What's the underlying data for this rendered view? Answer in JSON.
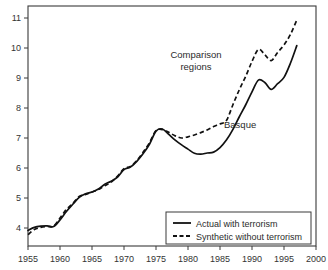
{
  "chart_data": {
    "type": "line",
    "title": "",
    "xlabel": "",
    "ylabel": "",
    "xlim": [
      1955,
      2000
    ],
    "ylim": [
      3.4,
      11.4
    ],
    "grid": false,
    "legend_position": "bottom-right",
    "xticks": [
      1955,
      1960,
      1965,
      1970,
      1975,
      1980,
      1985,
      1990,
      1995,
      2000
    ],
    "yticks": [
      4,
      5,
      6,
      7,
      8,
      9,
      10,
      11
    ],
    "x": [
      1955,
      1956,
      1957,
      1958,
      1959,
      1960,
      1961,
      1962,
      1963,
      1964,
      1965,
      1966,
      1967,
      1968,
      1969,
      1970,
      1971,
      1972,
      1973,
      1974,
      1975,
      1976,
      1977,
      1978,
      1979,
      1980,
      1981,
      1982,
      1983,
      1984,
      1985,
      1986,
      1987,
      1988,
      1989,
      1990,
      1991,
      1992,
      1993,
      1994,
      1995,
      1996,
      1997
    ],
    "series": [
      {
        "name": "Actual with terrorism",
        "style": "solid",
        "annotation": "Basque",
        "values": [
          3.92,
          4.02,
          4.06,
          4.07,
          4.05,
          4.27,
          4.55,
          4.79,
          5.02,
          5.14,
          5.2,
          5.3,
          5.46,
          5.56,
          5.7,
          5.95,
          6.03,
          6.22,
          6.48,
          6.8,
          7.23,
          7.3,
          7.12,
          6.93,
          6.77,
          6.63,
          6.49,
          6.46,
          6.5,
          6.53,
          6.68,
          6.93,
          7.28,
          7.7,
          8.1,
          8.54,
          8.93,
          8.85,
          8.62,
          8.81,
          9.02,
          9.49,
          10.08
        ]
      },
      {
        "name": "Synthetic without terrorism",
        "style": "dashed",
        "annotation": "Comparison regions",
        "values": [
          3.78,
          3.95,
          4.02,
          4.05,
          4.06,
          4.33,
          4.62,
          4.82,
          5.05,
          5.12,
          5.2,
          5.28,
          5.41,
          5.53,
          5.73,
          5.98,
          6.05,
          6.25,
          6.53,
          6.85,
          7.25,
          7.28,
          7.19,
          7.07,
          7.0,
          7.04,
          7.1,
          7.18,
          7.27,
          7.38,
          7.47,
          7.58,
          8.1,
          8.6,
          9.05,
          9.55,
          9.95,
          9.78,
          9.58,
          9.85,
          10.1,
          10.45,
          10.93
        ]
      }
    ],
    "annotations": [
      {
        "text_line1": "Comparison",
        "text_line2": "regions",
        "target_series": "Synthetic without terrorism"
      },
      {
        "text_line1": "Basque",
        "text_line2": "",
        "target_series": "Actual with terrorism"
      }
    ]
  },
  "legend": {
    "entries": [
      {
        "label": "Actual with terrorism",
        "style": "solid"
      },
      {
        "label": "Synthetic without terrorism",
        "style": "dashed"
      }
    ]
  },
  "colors": {
    "line": "#111111",
    "axis": "#3a3a3a",
    "text": "#2b2b2b",
    "background": "#ffffff"
  }
}
